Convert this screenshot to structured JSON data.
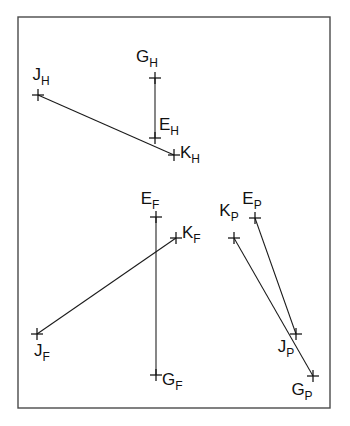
{
  "figure": {
    "width": 350,
    "height": 426,
    "background_color": "#ffffff",
    "ink_color": "#111111",
    "frame_color": "#4a4a4a",
    "frame": {
      "x": 18,
      "y": 17,
      "width": 312,
      "height": 391
    }
  },
  "groups": [
    {
      "id": "H",
      "subscript": "H",
      "points": [
        {
          "id": "G_H",
          "base": "G",
          "sub": "H",
          "x": 155,
          "y": 78,
          "label_x": 147,
          "label_y": 62,
          "label_anchor": "middle"
        },
        {
          "id": "J_H",
          "base": "J",
          "sub": "H",
          "x": 38,
          "y": 95,
          "label_x": 41,
          "label_y": 80,
          "label_anchor": "middle"
        },
        {
          "id": "E_H",
          "base": "E",
          "sub": "H",
          "x": 155,
          "y": 138,
          "label_x": 159,
          "label_y": 130,
          "label_anchor": "start"
        },
        {
          "id": "K_H",
          "base": "K",
          "sub": "H",
          "x": 174,
          "y": 155,
          "label_x": 180,
          "label_y": 158,
          "label_anchor": "start"
        }
      ],
      "segments": [
        {
          "from": "G_H",
          "to": "E_H"
        },
        {
          "from": "J_H",
          "to": "K_H"
        }
      ]
    },
    {
      "id": "F",
      "subscript": "F",
      "points": [
        {
          "id": "E_F",
          "base": "E",
          "sub": "F",
          "x": 156,
          "y": 217,
          "label_x": 150,
          "label_y": 204,
          "label_anchor": "middle"
        },
        {
          "id": "K_F",
          "base": "K",
          "sub": "F",
          "x": 176,
          "y": 238,
          "label_x": 182,
          "label_y": 238,
          "label_anchor": "start"
        },
        {
          "id": "J_F",
          "base": "J",
          "sub": "F",
          "x": 37,
          "y": 334,
          "label_x": 42,
          "label_y": 356,
          "label_anchor": "middle"
        },
        {
          "id": "G_F",
          "base": "G",
          "sub": "F",
          "x": 156,
          "y": 375,
          "label_x": 162,
          "label_y": 385,
          "label_anchor": "start"
        }
      ],
      "segments": [
        {
          "from": "E_F",
          "to": "G_F"
        },
        {
          "from": "J_F",
          "to": "K_F"
        }
      ]
    },
    {
      "id": "P",
      "subscript": "P",
      "points": [
        {
          "id": "E_P",
          "base": "E",
          "sub": "P",
          "x": 255,
          "y": 218,
          "label_x": 252,
          "label_y": 204,
          "label_anchor": "middle"
        },
        {
          "id": "K_P",
          "base": "K",
          "sub": "P",
          "x": 234,
          "y": 238,
          "label_x": 229,
          "label_y": 216,
          "label_anchor": "middle"
        },
        {
          "id": "J_P",
          "base": "J",
          "sub": "P",
          "x": 296,
          "y": 334,
          "label_x": 286,
          "label_y": 352,
          "label_anchor": "middle"
        },
        {
          "id": "G_P",
          "base": "G",
          "sub": "P",
          "x": 313,
          "y": 376,
          "label_x": 302,
          "label_y": 395,
          "label_anchor": "middle"
        }
      ],
      "segments": [
        {
          "from": "E_P",
          "to": "J_P"
        },
        {
          "from": "K_P",
          "to": "G_P"
        }
      ]
    }
  ],
  "marker": {
    "style": "plus-cross",
    "arm_length": 6
  }
}
